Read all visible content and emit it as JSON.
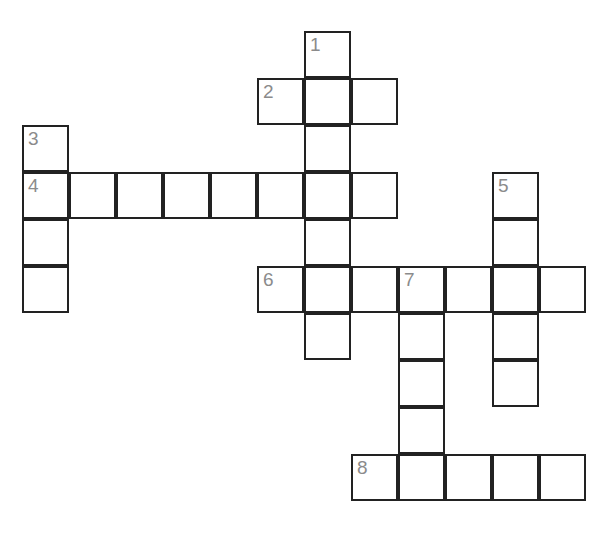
{
  "puzzle": {
    "type": "crossword-grid",
    "background_color": "#ffffff",
    "cell_fill_color": "#ffffff",
    "cell_border_color": "#222222",
    "number_color": "#8b8b8b",
    "cell_size_px": 47,
    "grid_origin": {
      "x": 22,
      "y": 31
    },
    "canvas": {
      "width": 611,
      "height": 541
    },
    "columns": 12,
    "rows": 11,
    "clue_numbers": [
      "1",
      "2",
      "3",
      "4",
      "5",
      "6",
      "7",
      "8"
    ],
    "entries": [
      {
        "number": "1",
        "direction": "down",
        "length": 5,
        "start_col": 6,
        "start_row": 0,
        "cells": [
          {
            "col": 6,
            "row": 0,
            "number": "1",
            "letter": ""
          },
          {
            "col": 6,
            "row": 1,
            "number": "",
            "letter": ""
          },
          {
            "col": 6,
            "row": 2,
            "number": "",
            "letter": ""
          },
          {
            "col": 6,
            "row": 3,
            "number": "",
            "letter": ""
          },
          {
            "col": 6,
            "row": 4,
            "number": "",
            "letter": ""
          },
          {
            "col": 6,
            "row": 5,
            "number": "",
            "letter": ""
          },
          {
            "col": 6,
            "row": 6,
            "number": "",
            "letter": ""
          }
        ]
      },
      {
        "number": "2",
        "direction": "across",
        "length": 3,
        "start_col": 5,
        "start_row": 1,
        "cells": [
          {
            "col": 5,
            "row": 1,
            "number": "2",
            "letter": ""
          },
          {
            "col": 7,
            "row": 1,
            "number": "",
            "letter": ""
          }
        ]
      },
      {
        "number": "3",
        "direction": "down",
        "length": 4,
        "start_col": 0,
        "start_row": 2,
        "cells": [
          {
            "col": 0,
            "row": 2,
            "number": "3",
            "letter": ""
          },
          {
            "col": 0,
            "row": 4,
            "number": "",
            "letter": ""
          },
          {
            "col": 0,
            "row": 5,
            "number": "",
            "letter": ""
          }
        ]
      },
      {
        "number": "4",
        "direction": "across",
        "length": 8,
        "start_col": 0,
        "start_row": 3,
        "cells": [
          {
            "col": 0,
            "row": 3,
            "number": "4",
            "letter": ""
          },
          {
            "col": 1,
            "row": 3,
            "number": "",
            "letter": ""
          },
          {
            "col": 2,
            "row": 3,
            "number": "",
            "letter": ""
          },
          {
            "col": 3,
            "row": 3,
            "number": "",
            "letter": ""
          },
          {
            "col": 4,
            "row": 3,
            "number": "",
            "letter": ""
          },
          {
            "col": 5,
            "row": 3,
            "number": "",
            "letter": ""
          },
          {
            "col": 7,
            "row": 3,
            "number": "",
            "letter": ""
          }
        ]
      },
      {
        "number": "5",
        "direction": "down",
        "length": 5,
        "start_col": 10,
        "start_row": 3,
        "cells": [
          {
            "col": 10,
            "row": 3,
            "number": "5",
            "letter": ""
          },
          {
            "col": 10,
            "row": 4,
            "number": "",
            "letter": ""
          },
          {
            "col": 10,
            "row": 6,
            "number": "",
            "letter": ""
          },
          {
            "col": 10,
            "row": 7,
            "number": "",
            "letter": ""
          }
        ]
      },
      {
        "number": "6",
        "direction": "across",
        "length": 7,
        "start_col": 5,
        "start_row": 5,
        "cells": [
          {
            "col": 5,
            "row": 5,
            "number": "6",
            "letter": ""
          },
          {
            "col": 7,
            "row": 5,
            "number": "",
            "letter": ""
          },
          {
            "col": 9,
            "row": 5,
            "number": "",
            "letter": ""
          },
          {
            "col": 11,
            "row": 5,
            "number": "",
            "letter": ""
          }
        ]
      },
      {
        "number": "7",
        "direction": "down",
        "length": 5,
        "start_col": 8,
        "start_row": 5,
        "cells": [
          {
            "col": 8,
            "row": 5,
            "number": "7",
            "letter": ""
          },
          {
            "col": 8,
            "row": 6,
            "number": "",
            "letter": ""
          },
          {
            "col": 8,
            "row": 7,
            "number": "",
            "letter": ""
          },
          {
            "col": 8,
            "row": 8,
            "number": "",
            "letter": ""
          }
        ]
      },
      {
        "number": "8",
        "direction": "across",
        "length": 5,
        "start_col": 7,
        "start_row": 9,
        "cells": [
          {
            "col": 7,
            "row": 9,
            "number": "8",
            "letter": ""
          },
          {
            "col": 9,
            "row": 9,
            "number": "",
            "letter": ""
          },
          {
            "col": 10,
            "row": 9,
            "number": "",
            "letter": ""
          },
          {
            "col": 11,
            "row": 9,
            "number": "",
            "letter": ""
          }
        ]
      }
    ],
    "all_cells": [
      {
        "col": 6,
        "row": 0,
        "number": "1",
        "letter": ""
      },
      {
        "col": 5,
        "row": 1,
        "number": "2",
        "letter": ""
      },
      {
        "col": 6,
        "row": 1,
        "number": "",
        "letter": ""
      },
      {
        "col": 7,
        "row": 1,
        "number": "",
        "letter": ""
      },
      {
        "col": 0,
        "row": 2,
        "number": "3",
        "letter": ""
      },
      {
        "col": 6,
        "row": 2,
        "number": "",
        "letter": ""
      },
      {
        "col": 0,
        "row": 3,
        "number": "4",
        "letter": ""
      },
      {
        "col": 1,
        "row": 3,
        "number": "",
        "letter": ""
      },
      {
        "col": 2,
        "row": 3,
        "number": "",
        "letter": ""
      },
      {
        "col": 3,
        "row": 3,
        "number": "",
        "letter": ""
      },
      {
        "col": 4,
        "row": 3,
        "number": "",
        "letter": ""
      },
      {
        "col": 5,
        "row": 3,
        "number": "",
        "letter": ""
      },
      {
        "col": 6,
        "row": 3,
        "number": "",
        "letter": ""
      },
      {
        "col": 7,
        "row": 3,
        "number": "",
        "letter": ""
      },
      {
        "col": 10,
        "row": 3,
        "number": "5",
        "letter": ""
      },
      {
        "col": 0,
        "row": 4,
        "number": "",
        "letter": ""
      },
      {
        "col": 6,
        "row": 4,
        "number": "",
        "letter": ""
      },
      {
        "col": 10,
        "row": 4,
        "number": "",
        "letter": ""
      },
      {
        "col": 0,
        "row": 5,
        "number": "",
        "letter": ""
      },
      {
        "col": 5,
        "row": 5,
        "number": "6",
        "letter": ""
      },
      {
        "col": 6,
        "row": 5,
        "number": "",
        "letter": ""
      },
      {
        "col": 7,
        "row": 5,
        "number": "",
        "letter": ""
      },
      {
        "col": 8,
        "row": 5,
        "number": "7",
        "letter": ""
      },
      {
        "col": 9,
        "row": 5,
        "number": "",
        "letter": ""
      },
      {
        "col": 10,
        "row": 5,
        "number": "",
        "letter": ""
      },
      {
        "col": 11,
        "row": 5,
        "number": "",
        "letter": ""
      },
      {
        "col": 6,
        "row": 6,
        "number": "",
        "letter": ""
      },
      {
        "col": 8,
        "row": 6,
        "number": "",
        "letter": ""
      },
      {
        "col": 10,
        "row": 6,
        "number": "",
        "letter": ""
      },
      {
        "col": 8,
        "row": 7,
        "number": "",
        "letter": ""
      },
      {
        "col": 10,
        "row": 7,
        "number": "",
        "letter": ""
      },
      {
        "col": 8,
        "row": 8,
        "number": "",
        "letter": ""
      },
      {
        "col": 7,
        "row": 9,
        "number": "8",
        "letter": ""
      },
      {
        "col": 8,
        "row": 9,
        "number": "",
        "letter": ""
      },
      {
        "col": 9,
        "row": 9,
        "number": "",
        "letter": ""
      },
      {
        "col": 10,
        "row": 9,
        "number": "",
        "letter": ""
      },
      {
        "col": 11,
        "row": 9,
        "number": "",
        "letter": ""
      }
    ]
  }
}
